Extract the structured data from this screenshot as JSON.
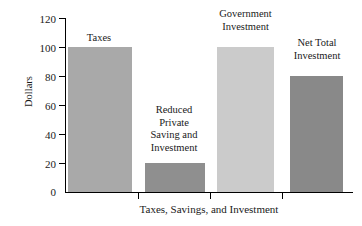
{
  "chart_data": {
    "type": "bar",
    "title": "",
    "xlabel": "Taxes, Savings, and Investment",
    "ylabel": "Dollars",
    "ylim": [
      0,
      120
    ],
    "yticks": [
      0,
      20,
      40,
      60,
      80,
      100,
      120
    ],
    "ytick_labels": [
      "0",
      "20",
      "40",
      "60",
      "80",
      "100",
      "120"
    ],
    "grid": false,
    "legend": "none",
    "categories": [
      "Taxes",
      "Reduced Private Saving and Investment",
      "Government Investment",
      "Net Total Investment"
    ],
    "values": [
      100,
      20,
      100,
      80
    ],
    "bar_colors": [
      "#a9a9a9",
      "#8f8f8f",
      "#cbcbcb",
      "#898989"
    ],
    "bar_labels": [
      "Taxes",
      "Reduced\nPrivate\nSaving and\nInvestment",
      "Government\nInvestment",
      "Net Total\nInvestment"
    ],
    "axis_color": "#000000",
    "background": "#ffffff"
  }
}
